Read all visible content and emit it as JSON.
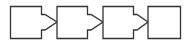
{
  "diagram": {
    "type": "process-flow",
    "stroke_color": "#333333",
    "fill_color": "#ffffff",
    "steps": [
      {
        "id": 1,
        "label": "",
        "has_arrow": true
      },
      {
        "id": 2,
        "label": "",
        "has_arrow": true
      },
      {
        "id": 3,
        "label": "",
        "has_arrow": true
      },
      {
        "id": 4,
        "label": "",
        "has_arrow": false
      }
    ]
  }
}
